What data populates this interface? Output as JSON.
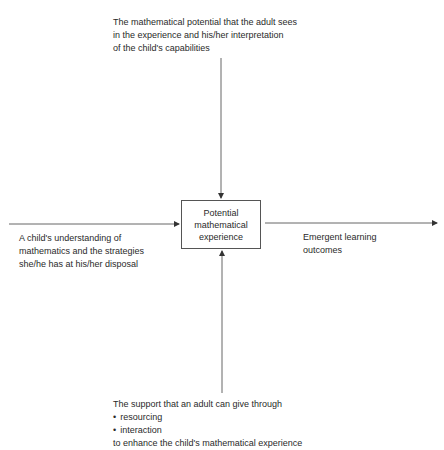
{
  "diagram": {
    "center_box": {
      "lines": [
        "Potential",
        "mathematical",
        "experience"
      ]
    },
    "top_text": {
      "lines": [
        "The mathematical potential that the adult sees",
        "in the experience and his/her interpretation",
        "of the child's capabilities"
      ]
    },
    "left_text": {
      "lines": [
        "A child's understanding of",
        "mathematics and the strategies",
        "she/he has at his/her disposal"
      ]
    },
    "right_text": {
      "lines": [
        "Emergent learning",
        "outcomes"
      ]
    },
    "bottom_text": {
      "intro": "The support that an adult can give through",
      "bullets": [
        "resourcing",
        "interaction"
      ],
      "outro": "to enhance the child's mathematical experience"
    },
    "arrows": [
      {
        "from": "top_text",
        "to": "center_box",
        "direction": "down"
      },
      {
        "from": "left_text",
        "to": "center_box",
        "direction": "right"
      },
      {
        "from": "bottom_text",
        "to": "center_box",
        "direction": "up"
      },
      {
        "from": "center_box",
        "to": "right_text",
        "direction": "right"
      }
    ],
    "colors": {
      "line": "#555555",
      "text": "#2a2a2a",
      "background": "#ffffff"
    }
  }
}
